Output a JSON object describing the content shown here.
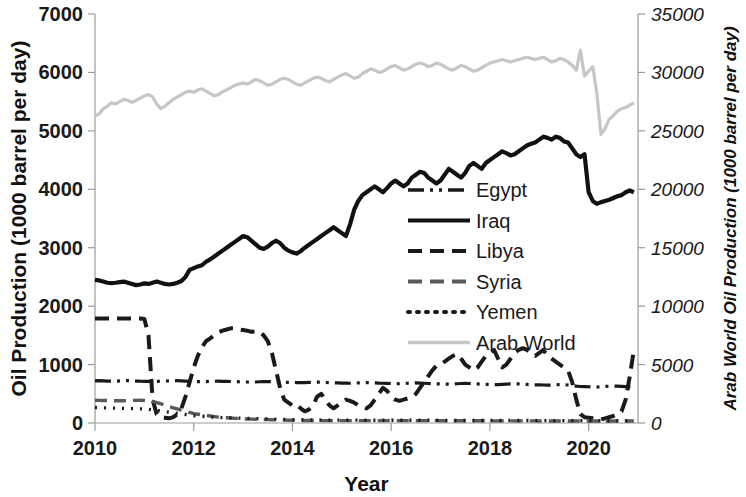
{
  "chart_data": {
    "type": "line",
    "title": "",
    "xlabel": "Year",
    "ylabel": "Oil Production (1000 barrel per day)",
    "ylabel_right": "Arab World Oil Production (1000 barrel per day)",
    "xlim": [
      2010.0,
      2021.0
    ],
    "ylim": [
      0,
      7000
    ],
    "ylim_right": [
      0,
      35000
    ],
    "xticks": [
      2010,
      2012,
      2014,
      2016,
      2018,
      2020
    ],
    "xtick_labels": [
      "2010",
      "2012",
      "2014",
      "2016",
      "2018",
      "2020"
    ],
    "yticks": [
      0,
      1000,
      2000,
      3000,
      4000,
      5000,
      6000,
      7000
    ],
    "ytick_labels": [
      "0",
      "1000",
      "2000",
      "3000",
      "4000",
      "5000",
      "6000",
      "7000"
    ],
    "yticks_right": [
      0,
      5000,
      10000,
      15000,
      20000,
      25000,
      30000,
      35000
    ],
    "ytick_labels_right": [
      "0",
      "5000",
      "10000",
      "15000",
      "20000",
      "25000",
      "30000",
      "35000"
    ],
    "grid": false,
    "legend_position": "center-right",
    "x_start": 2010.0,
    "x_step": 0.0833333,
    "series": [
      {
        "name": "Egypt",
        "axis": "left",
        "color": "#1a1a1a",
        "style": "dashdotdot",
        "width": 3.2,
        "dasharray": "16,6,3,6,3,6",
        "values": [
          720,
          725,
          722,
          718,
          715,
          716,
          720,
          724,
          726,
          722,
          718,
          715,
          714,
          712,
          710,
          712,
          715,
          718,
          720,
          722,
          724,
          720,
          716,
          712,
          710,
          708,
          706,
          708,
          712,
          714,
          716,
          714,
          712,
          710,
          708,
          706,
          704,
          702,
          700,
          702,
          706,
          708,
          710,
          708,
          704,
          700,
          698,
          696,
          694,
          692,
          690,
          692,
          696,
          698,
          700,
          698,
          694,
          690,
          688,
          686,
          684,
          682,
          680,
          682,
          686,
          690,
          692,
          690,
          686,
          682,
          680,
          678,
          676,
          674,
          672,
          676,
          680,
          684,
          686,
          684,
          680,
          676,
          672,
          670,
          668,
          666,
          664,
          668,
          672,
          676,
          678,
          676,
          672,
          668,
          664,
          662,
          660,
          658,
          656,
          660,
          664,
          668,
          670,
          668,
          664,
          660,
          656,
          654,
          652,
          650,
          648,
          650,
          654,
          656,
          658,
          650,
          640,
          630,
          625,
          622,
          620,
          618,
          616,
          620,
          625,
          630,
          632,
          630,
          626,
          622,
          618,
          616
        ]
      },
      {
        "name": "Iraq",
        "axis": "left",
        "color": "#111111",
        "style": "solid",
        "width": 4.2,
        "dasharray": "",
        "values": [
          2450,
          2440,
          2420,
          2400,
          2395,
          2400,
          2410,
          2420,
          2400,
          2380,
          2360,
          2370,
          2390,
          2380,
          2400,
          2420,
          2400,
          2380,
          2370,
          2380,
          2400,
          2430,
          2500,
          2620,
          2650,
          2680,
          2700,
          2760,
          2800,
          2850,
          2900,
          2950,
          3000,
          3050,
          3100,
          3150,
          3200,
          3180,
          3120,
          3060,
          3000,
          2980,
          3020,
          3080,
          3120,
          3080,
          3000,
          2950,
          2920,
          2900,
          2940,
          3000,
          3050,
          3100,
          3150,
          3200,
          3250,
          3300,
          3350,
          3300,
          3250,
          3200,
          3400,
          3650,
          3800,
          3900,
          3950,
          4000,
          4050,
          4000,
          3950,
          4020,
          4100,
          4150,
          4100,
          4050,
          4100,
          4200,
          4250,
          4300,
          4280,
          4200,
          4150,
          4100,
          4150,
          4250,
          4350,
          4300,
          4250,
          4200,
          4280,
          4400,
          4450,
          4400,
          4350,
          4450,
          4500,
          4550,
          4600,
          4650,
          4620,
          4580,
          4600,
          4650,
          4700,
          4750,
          4780,
          4800,
          4850,
          4900,
          4880,
          4850,
          4900,
          4880,
          4820,
          4800,
          4700,
          4600,
          4550,
          4600,
          3950,
          3800,
          3750,
          3780,
          3800,
          3820,
          3850,
          3880,
          3900,
          3950,
          3980,
          3950
        ]
      },
      {
        "name": "Libya",
        "axis": "left",
        "color": "#1a1a1a",
        "style": "dashed",
        "width": 4.0,
        "dasharray": "14,8",
        "values": [
          1790,
          1790,
          1790,
          1790,
          1790,
          1790,
          1790,
          1790,
          1790,
          1790,
          1790,
          1790,
          1780,
          1500,
          400,
          150,
          100,
          90,
          80,
          100,
          150,
          250,
          450,
          700,
          950,
          1150,
          1300,
          1400,
          1450,
          1500,
          1550,
          1580,
          1600,
          1620,
          1620,
          1600,
          1590,
          1580,
          1560,
          1570,
          1560,
          1500,
          1400,
          1200,
          900,
          600,
          400,
          350,
          300,
          320,
          250,
          200,
          230,
          300,
          450,
          500,
          400,
          300,
          250,
          300,
          350,
          400,
          380,
          350,
          300,
          280,
          250,
          300,
          400,
          500,
          600,
          550,
          450,
          400,
          380,
          400,
          420,
          450,
          500,
          600,
          700,
          800,
          900,
          980,
          1000,
          1050,
          1100,
          1150,
          1180,
          1100,
          1000,
          950,
          900,
          950,
          1050,
          1150,
          1200,
          1250,
          1100,
          950,
          1000,
          1100,
          1200,
          1250,
          1280,
          1250,
          1200,
          1150,
          1200,
          1250,
          1150,
          1100,
          1050,
          1000,
          950,
          900,
          700,
          400,
          150,
          100,
          90,
          80,
          70,
          60,
          80,
          100,
          120,
          150,
          200,
          400,
          800,
          1250
        ]
      },
      {
        "name": "Syria",
        "axis": "left",
        "color": "#5a5a5a",
        "style": "dashed",
        "width": 3.4,
        "dasharray": "12,7",
        "values": [
          390,
          388,
          386,
          385,
          384,
          382,
          380,
          382,
          384,
          386,
          388,
          390,
          385,
          380,
          370,
          350,
          330,
          300,
          280,
          260,
          240,
          220,
          200,
          180,
          160,
          150,
          140,
          130,
          120,
          110,
          100,
          95,
          90,
          85,
          80,
          75,
          70,
          68,
          66,
          64,
          62,
          60,
          58,
          56,
          54,
          52,
          50,
          48,
          46,
          45,
          44,
          43,
          42,
          42,
          41,
          41,
          40,
          40,
          40,
          40,
          40,
          40,
          40,
          40,
          40,
          40,
          40,
          40,
          40,
          40,
          40,
          40,
          40,
          40,
          40,
          40,
          40,
          40,
          40,
          40,
          40,
          40,
          40,
          40,
          38,
          38,
          38,
          38,
          38,
          38,
          38,
          38,
          38,
          38,
          38,
          38,
          36,
          36,
          36,
          36,
          36,
          36,
          36,
          36,
          36,
          36,
          36,
          36,
          35,
          35,
          35,
          35,
          35,
          35,
          35,
          35,
          35,
          35,
          35,
          35,
          34,
          34,
          34,
          34,
          34,
          34,
          34,
          34,
          34,
          34,
          34,
          34
        ]
      },
      {
        "name": "Yemen",
        "axis": "left",
        "color": "#1a1a1a",
        "style": "dotted",
        "width": 3.4,
        "dasharray": "2,7",
        "values": [
          265,
          262,
          260,
          258,
          256,
          254,
          252,
          250,
          248,
          246,
          244,
          242,
          240,
          235,
          225,
          215,
          205,
          195,
          185,
          175,
          165,
          155,
          145,
          135,
          125,
          120,
          115,
          110,
          105,
          100,
          95,
          92,
          90,
          88,
          86,
          84,
          82,
          80,
          78,
          76,
          74,
          72,
          70,
          68,
          66,
          64,
          62,
          60,
          58,
          56,
          55,
          54,
          53,
          52,
          51,
          50,
          50,
          50,
          50,
          50,
          50,
          50,
          50,
          50,
          48,
          48,
          48,
          48,
          48,
          48,
          48,
          48,
          46,
          46,
          46,
          46,
          46,
          46,
          46,
          46,
          46,
          46,
          46,
          46,
          44,
          44,
          44,
          44,
          44,
          44,
          44,
          44,
          44,
          44,
          44,
          44,
          42,
          42,
          42,
          42,
          42,
          42,
          42,
          42,
          42,
          42,
          42,
          42,
          40,
          40,
          40,
          40,
          40,
          40,
          40,
          40,
          40,
          40,
          40,
          40,
          38,
          38,
          38,
          38,
          38,
          38,
          38,
          38,
          38,
          38,
          38,
          38
        ]
      },
      {
        "name": "Arab World",
        "axis": "right",
        "color": "#c6c6c6",
        "style": "solid",
        "width": 3.2,
        "dasharray": "",
        "values": [
          26300,
          26450,
          26900,
          27100,
          27400,
          27300,
          27500,
          27700,
          27600,
          27450,
          27600,
          27800,
          28000,
          28100,
          27900,
          27300,
          26900,
          27100,
          27400,
          27700,
          27900,
          28100,
          28300,
          28400,
          28300,
          28500,
          28600,
          28400,
          28200,
          28000,
          28100,
          28350,
          28500,
          28700,
          28900,
          29000,
          29100,
          29000,
          29200,
          29400,
          29300,
          29100,
          28900,
          29000,
          29200,
          29400,
          29500,
          29400,
          29200,
          29000,
          28900,
          29100,
          29300,
          29500,
          29600,
          29500,
          29300,
          29200,
          29400,
          29600,
          29800,
          29900,
          29700,
          29500,
          29600,
          29900,
          30100,
          30300,
          30200,
          30000,
          30100,
          30300,
          30500,
          30600,
          30400,
          30200,
          30300,
          30500,
          30700,
          30800,
          30700,
          30500,
          30600,
          30800,
          30700,
          30500,
          30300,
          30200,
          30400,
          30600,
          30500,
          30300,
          30100,
          30200,
          30400,
          30600,
          30800,
          30900,
          31000,
          31100,
          31000,
          30900,
          31000,
          31100,
          31200,
          31300,
          31200,
          31100,
          31200,
          31300,
          31100,
          30900,
          31000,
          31200,
          31100,
          30900,
          30600,
          30200,
          31900,
          29700,
          30100,
          30500,
          28200,
          24700,
          25200,
          26000,
          26300,
          26700,
          26900,
          27000,
          27200,
          27400
        ]
      }
    ],
    "legend_entries": [
      {
        "label": "Egypt",
        "style": "dashdotdot",
        "color": "#1a1a1a"
      },
      {
        "label": "Iraq",
        "style": "solid",
        "color": "#111111"
      },
      {
        "label": "Libya",
        "style": "dashed",
        "color": "#1a1a1a"
      },
      {
        "label": "Syria",
        "style": "dashed",
        "color": "#5a5a5a"
      },
      {
        "label": "Yemen",
        "style": "dotted",
        "color": "#1a1a1a"
      },
      {
        "label": "Arab World",
        "style": "solid",
        "color": "#c6c6c6"
      }
    ]
  }
}
